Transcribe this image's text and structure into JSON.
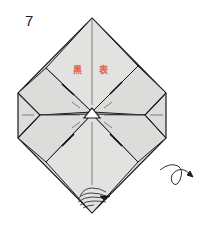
{
  "step": {
    "number": "7"
  },
  "labels": {
    "left": "黒",
    "right": "表"
  },
  "colors": {
    "paper": "#dcdcda",
    "line": "#1a1a1a",
    "label": "#e8603a",
    "crease": "#555555"
  },
  "icons": {
    "center": "triangle-marker-icon",
    "turn": "turn-over-arrow-icon",
    "corner": "layered-corner-icon"
  }
}
